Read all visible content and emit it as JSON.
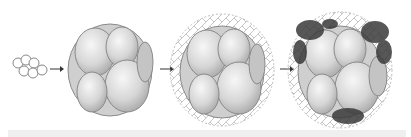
{
  "diagram": {
    "type": "cell-development-sequence",
    "stages": [
      {
        "id": "stage-1",
        "name": "small-cell-cluster"
      },
      {
        "id": "stage-2",
        "name": "morula-like-cluster"
      },
      {
        "id": "stage-3",
        "name": "cluster-with-fibrous-matrix"
      },
      {
        "id": "stage-4",
        "name": "cluster-with-matrix-and-dark-deposits"
      }
    ],
    "arrows": 3,
    "colors": {
      "background": "#ffffff",
      "cell_fill": "#d9d9d9",
      "cell_highlight": "#f2f2f2",
      "cell_outline": "#8a8a8a",
      "matrix": "#9a9a9a",
      "deposit": "#3a3a3a",
      "band": "#efefef"
    }
  }
}
